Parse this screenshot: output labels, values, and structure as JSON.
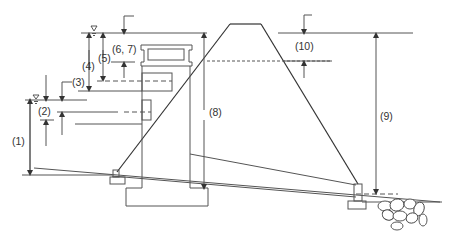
{
  "diagram": {
    "type": "cross-section",
    "labels": {
      "l1": "(1)",
      "l2": "(2)",
      "l3": "(3)",
      "l4": "(4)",
      "l5": "(5)",
      "l67": "(6, 7)",
      "l8": "(8)",
      "l9": "(9)",
      "l10": "(10)"
    },
    "symbols": {
      "water_level": "water-surface-triangle"
    },
    "colors": {
      "line": "#555555",
      "text": "#333333",
      "background": "#ffffff"
    }
  }
}
